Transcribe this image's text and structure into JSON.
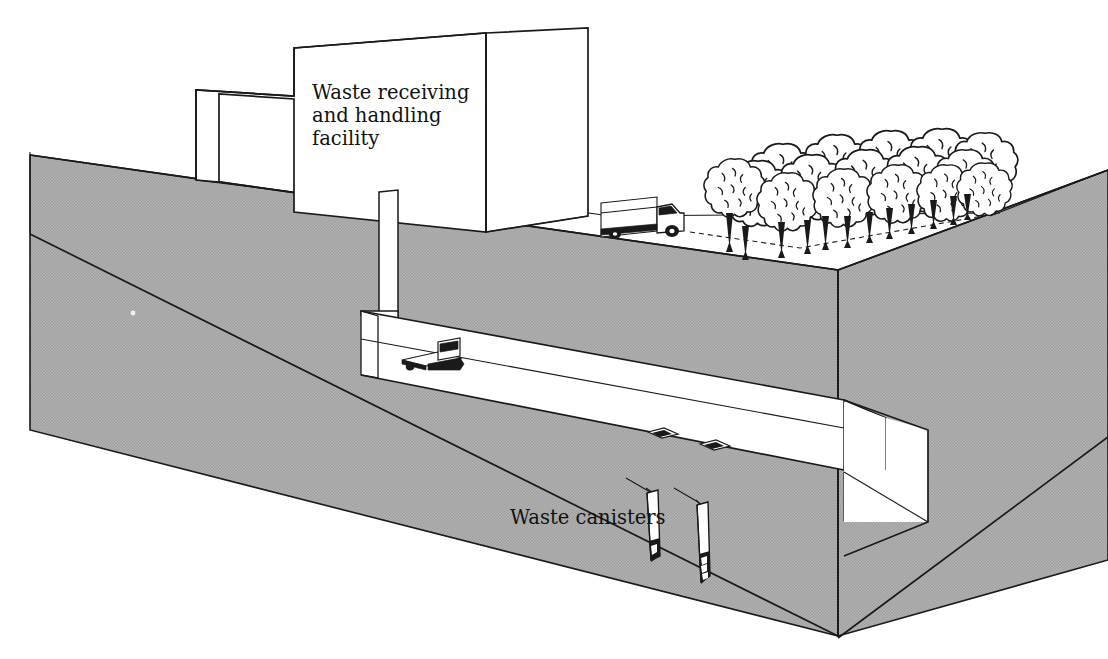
{
  "figure": {
    "type": "cutaway-block-diagram",
    "background_color": "#ffffff",
    "ink_color": "#1a1a1a"
  },
  "labels": {
    "facility": {
      "text": "Waste receiving\nand handling\nfacility",
      "lines": [
        "Waste receiving",
        "and handling",
        "facility"
      ],
      "x": 312,
      "y": 99
    },
    "canisters": {
      "text": "Waste canisters",
      "lines": [
        "Waste canisters"
      ],
      "x": 510,
      "y": 524
    }
  },
  "ground_block": {
    "name": "earth-block",
    "fill_color": "#adadad",
    "edge_color": "#1a1a1a",
    "top_surface_color": "#ffffff",
    "description": "Cut-away rectangular block of earth shown in axonometric projection with two exposed gray cut faces"
  },
  "building": {
    "name": "waste-receiving-and-handling-facility",
    "fill_color": "#ffffff",
    "stroke_color": "#1a1a1a",
    "description": "Stepped white box building with tall block at right and lower wing at left"
  },
  "surface_road": {
    "name": "surface-road",
    "fill_color": "#ffffff",
    "description": "White paved apron running from facility toward tree stand"
  },
  "surface_truck": {
    "name": "delivery-truck",
    "count": 1,
    "description": "Box delivery truck on the surface road, cab facing right",
    "body_color": "#ffffff",
    "detail_color": "#1a1a1a"
  },
  "trees": {
    "name": "tree-stand",
    "count": 16,
    "description": "Stand of deciduous trees with cloud-shaped canopies on the surface at right",
    "canopy_color": "#ffffff",
    "trunk_color": "#1a1a1a"
  },
  "shaft": {
    "name": "vertical-access-shaft",
    "fill_color": "#ffffff",
    "description": "Vertical shaft descending from the facility down to the underground drift"
  },
  "drift": {
    "name": "underground-drift-tunnel",
    "fill_color": "#ffffff",
    "description": "Horizontal underground tunnel running left to right through the earth block, exiting at the right corner"
  },
  "drift_vehicle": {
    "name": "underground-transporter",
    "count": 1,
    "description": "Flatbed transport vehicle inside the drift near the shaft base"
  },
  "boreholes": {
    "name": "emplacement-borehole-openings",
    "count": 2,
    "description": "Two diamond-shaped borehole collars in the drift floor",
    "color": "#1a1a1a"
  },
  "canisters": {
    "name": "waste-canisters",
    "count": 2,
    "description": "Two vertical waste canisters emplaced in boreholes below the drift floor",
    "body_color": "#ffffff",
    "cap_color": "#1a1a1a",
    "leader_lines": 2
  }
}
